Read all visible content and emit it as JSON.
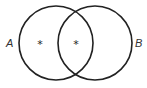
{
  "diagram": {
    "type": "venn",
    "sets": [
      {
        "label": "A",
        "cx": 56,
        "cy": 43,
        "r": 37
      },
      {
        "label": "B",
        "cx": 95,
        "cy": 43,
        "r": 37
      }
    ],
    "marks": [
      {
        "region": "A only",
        "symbol": "*",
        "x": 40,
        "y": 43
      },
      {
        "region": "A and B",
        "symbol": "*",
        "x": 76,
        "y": 43
      }
    ],
    "stroke_color": "#222222",
    "label_color": "#333333"
  }
}
